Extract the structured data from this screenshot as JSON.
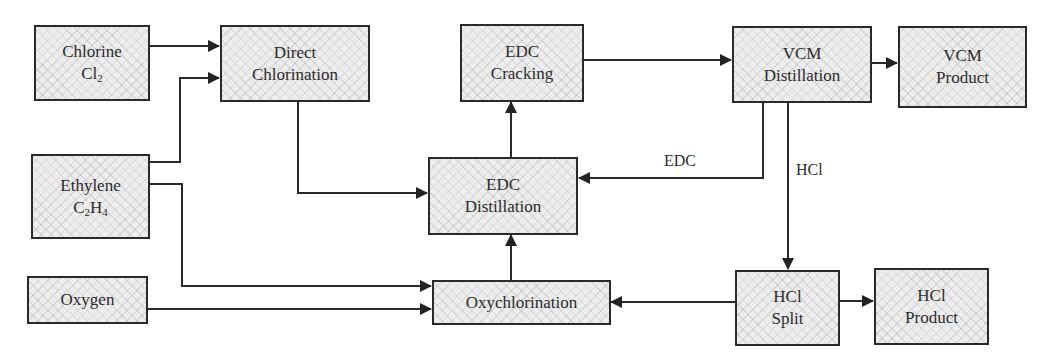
{
  "diagram": {
    "type": "process-flow",
    "nodes": {
      "chlorine": {
        "line1": "Chlorine",
        "formula_base": "Cl",
        "formula_sub": "2"
      },
      "ethylene": {
        "line1": "Ethylene",
        "formula_c": "C",
        "formula_c_sub": "2",
        "formula_h": "H",
        "formula_h_sub": "4"
      },
      "oxygen": {
        "line1": "Oxygen"
      },
      "direct_chlorination": {
        "line1": "Direct",
        "line2": "Chlorination"
      },
      "edc_cracking": {
        "line1": "EDC",
        "line2": "Cracking"
      },
      "edc_distillation": {
        "line1": "EDC",
        "line2": "Distillation"
      },
      "oxychlorination": {
        "line1": "Oxychlorination"
      },
      "vcm_distillation": {
        "line1": "VCM",
        "line2": "Distillation"
      },
      "vcm_product": {
        "line1": "VCM",
        "line2": "Product"
      },
      "hcl_split": {
        "line1": "HCl",
        "line2": "Split"
      },
      "hcl_product": {
        "line1": "HCl",
        "line2": "Product"
      }
    },
    "edge_labels": {
      "edc_recycle": "EDC",
      "hcl_stream": "HCl"
    },
    "edges": [
      {
        "from": "Chlorine",
        "to": "Direct Chlorination"
      },
      {
        "from": "Ethylene",
        "to": "Direct Chlorination"
      },
      {
        "from": "Ethylene",
        "to": "Oxychlorination"
      },
      {
        "from": "Oxygen",
        "to": "Oxychlorination"
      },
      {
        "from": "Direct Chlorination",
        "to": "EDC Distillation"
      },
      {
        "from": "Oxychlorination",
        "to": "EDC Distillation"
      },
      {
        "from": "EDC Distillation",
        "to": "EDC Cracking"
      },
      {
        "from": "EDC Cracking",
        "to": "VCM Distillation"
      },
      {
        "from": "VCM Distillation",
        "to": "VCM Product"
      },
      {
        "from": "VCM Distillation",
        "to": "EDC Distillation",
        "label": "EDC"
      },
      {
        "from": "VCM Distillation",
        "to": "HCl Split",
        "label": "HCl"
      },
      {
        "from": "HCl Split",
        "to": "Oxychlorination"
      },
      {
        "from": "HCl Split",
        "to": "HCl Product"
      }
    ],
    "colors": {
      "stroke": "#2a2a2a",
      "box_fill": "#ededed",
      "text": "#2b2b2b"
    }
  }
}
